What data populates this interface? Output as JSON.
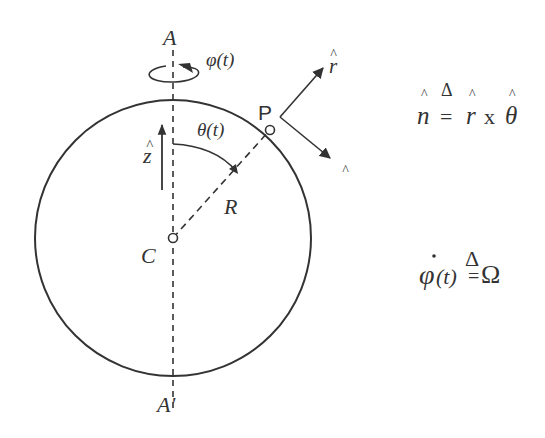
{
  "diagram": {
    "type": "rotating-sphere-geometry",
    "colors": {
      "stroke": "#333333",
      "background": "#ffffff"
    },
    "sphere": {
      "center_label": "C",
      "radius_label": "R"
    },
    "axis": {
      "top_label": "A",
      "bottom_label": "A'",
      "style": "dashed"
    },
    "rotation": {
      "label": "φ(t)",
      "icon": "circular-arrow-icon"
    },
    "z_axis": {
      "label": "ẑ",
      "hat": "^",
      "base": "z"
    },
    "polar_angle": {
      "label": "θ(t)"
    },
    "point": {
      "label": "P"
    },
    "unit_vectors": {
      "r": {
        "hat": "^",
        "base": "r"
      },
      "theta": {
        "hat": "^",
        "base": "θ"
      }
    },
    "equations": {
      "normal": {
        "lhs_hat": "^",
        "lhs": "n",
        "delta": "Δ",
        "equals": "=",
        "r_hat": "^",
        "r": "r",
        "cross": "x",
        "theta_hat": "^",
        "theta": "θ"
      },
      "angular_rate": {
        "dot": "˙",
        "lhs": "φ",
        "arg": "(t)",
        "delta": "Δ",
        "equals": "=",
        "rhs": "Ω"
      }
    }
  }
}
